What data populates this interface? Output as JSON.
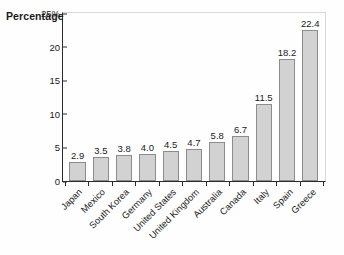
{
  "chart_data": {
    "type": "bar",
    "title": "",
    "subtitle": "",
    "xlabel": "",
    "ylabel": "Percentage",
    "ylim": [
      0,
      25
    ],
    "ytick_values": [
      0,
      5,
      10,
      15,
      20,
      25
    ],
    "ytick_labels": [
      "0",
      "5",
      "10",
      "15",
      "20",
      "25%"
    ],
    "grid": false,
    "legend": null,
    "bar_color": "#d2d2d2",
    "bar_edge_color": "#8c8c8c",
    "show_value_labels": true,
    "categories": [
      "Japan",
      "Mexico",
      "South Korea",
      "Germany",
      "United States",
      "United Kingdom",
      "Australia",
      "Canada",
      "Italy",
      "Spain",
      "Greece"
    ],
    "values": [
      2.9,
      3.5,
      3.8,
      4.0,
      4.5,
      4.7,
      5.8,
      6.7,
      11.5,
      18.2,
      22.4
    ],
    "value_labels": [
      "2.9",
      "3.5",
      "3.8",
      "4.0",
      "4.5",
      "4.7",
      "5.8",
      "6.7",
      "11.5",
      "18.2",
      "22.4"
    ]
  }
}
